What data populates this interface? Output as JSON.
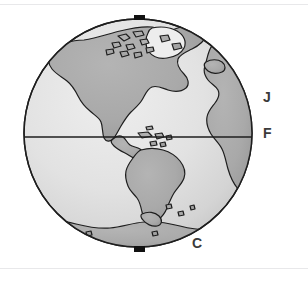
{
  "figure": {
    "kind": "globe-diagram",
    "projection": "orthographic",
    "centered_on": "Americas",
    "background_color": "#ffffff",
    "ocean_color": "#e3e3e3",
    "ocean_shade_color": "#cfcfcf",
    "land_color": "#a9a9a9",
    "outline_color": "#1e1e1e",
    "marker_color": "#111111",
    "rule_color": "#e8e8ea"
  },
  "labels": {
    "j": "J",
    "f": "F",
    "c": "C"
  },
  "markers": {
    "north_pole": "north-pole-marker",
    "south_pole": "south-pole-marker"
  },
  "lines": {
    "equator": "equator-line"
  },
  "icons": {
    "globe": "globe-icon",
    "north_marker": "pole-marker-icon",
    "south_marker": "pole-marker-icon"
  }
}
